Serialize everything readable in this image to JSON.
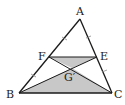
{
  "diagram": {
    "type": "geometry-triangle",
    "points": {
      "A": {
        "label": "A",
        "x": 80,
        "y": 19
      },
      "B": {
        "label": "B",
        "x": 19,
        "y": 93
      },
      "C": {
        "label": "C",
        "x": 112,
        "y": 93
      },
      "F": {
        "label": "F",
        "x": 49,
        "y": 57
      },
      "E": {
        "label": "E",
        "x": 97,
        "y": 57
      },
      "G": {
        "label": "G′",
        "x": 72,
        "y": 68
      }
    },
    "segments": [
      "AB",
      "AC",
      "BC",
      "FE",
      "FC",
      "EB"
    ],
    "shaded_regions": [
      "FEG′",
      "BCG′"
    ],
    "tick_marks": "AF = FB (single ticks), AE = EC (single ticks)",
    "colors": {
      "line": "#1a1a1a",
      "fill": "#c8c8c8",
      "tick": "#888888"
    }
  }
}
